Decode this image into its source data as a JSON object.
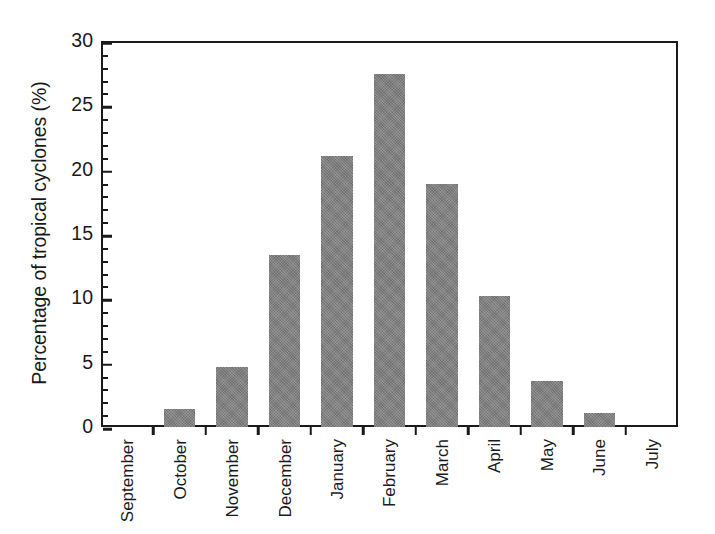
{
  "chart_data": {
    "type": "bar",
    "title": "",
    "subtitle": "",
    "xlabel": "",
    "ylabel": "Percentage of tropical cyclones (%)",
    "categories": [
      "September",
      "October",
      "November",
      "December",
      "January",
      "February",
      "March",
      "April",
      "May",
      "June",
      "July"
    ],
    "values": [
      0,
      1.4,
      4.7,
      13.4,
      21.1,
      27.4,
      18.9,
      10.2,
      3.6,
      1.1,
      0
    ],
    "series": [
      {
        "name": "Percentage of tropical cyclones",
        "values": [
          0,
          1.4,
          4.7,
          13.4,
          21.1,
          27.4,
          18.9,
          10.2,
          3.6,
          1.1,
          0
        ]
      }
    ],
    "ylim": [
      0,
      30
    ],
    "y_major_ticks": [
      0,
      5,
      10,
      15,
      20,
      25,
      30
    ],
    "y_minor_tick_interval": 1,
    "y_tick_labels": [
      "0",
      "5",
      "10",
      "15",
      "20",
      "25",
      "30"
    ],
    "grid": false,
    "legend": false,
    "legend_position": "none",
    "bar_color": "#7e7e7e",
    "axis_color": "#1a1a1a",
    "background_color": "#ffffff",
    "annotations": []
  }
}
